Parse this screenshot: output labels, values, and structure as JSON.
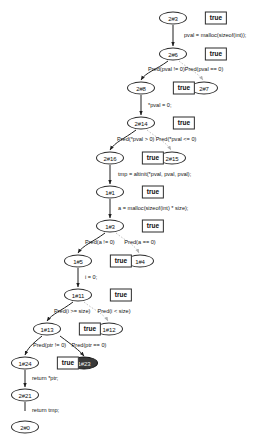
{
  "diagram": {
    "kind": "symbolic-execution-tree",
    "title": "",
    "nodes": [
      {
        "id": "n2_3",
        "label": "2#3",
        "x": 173,
        "y": 18,
        "selected": false
      },
      {
        "id": "n2_6",
        "label": "2#6",
        "x": 173,
        "y": 54,
        "selected": false
      },
      {
        "id": "n2_8",
        "label": "2#8",
        "x": 141,
        "y": 88,
        "selected": false
      },
      {
        "id": "n2_7",
        "label": "2#7",
        "x": 204,
        "y": 88,
        "selected": false
      },
      {
        "id": "n2_14",
        "label": "2#14",
        "x": 141,
        "y": 123,
        "selected": false
      },
      {
        "id": "n2_16",
        "label": "2#16",
        "x": 110,
        "y": 158,
        "selected": false
      },
      {
        "id": "n2_15",
        "label": "2#15",
        "x": 172,
        "y": 158,
        "selected": false
      },
      {
        "id": "n1_1",
        "label": "1#1",
        "x": 110,
        "y": 192,
        "selected": false
      },
      {
        "id": "n1_3",
        "label": "1#3",
        "x": 110,
        "y": 226,
        "selected": false
      },
      {
        "id": "n1_5",
        "label": "1#5",
        "x": 78,
        "y": 261,
        "selected": false
      },
      {
        "id": "n1_4",
        "label": "1#4",
        "x": 140,
        "y": 261,
        "selected": false
      },
      {
        "id": "n1_11",
        "label": "1#11",
        "x": 78,
        "y": 295,
        "selected": false
      },
      {
        "id": "n1_13",
        "label": "1#13",
        "x": 47,
        "y": 329,
        "selected": false
      },
      {
        "id": "n1_12",
        "label": "1#12",
        "x": 109,
        "y": 329,
        "selected": false
      },
      {
        "id": "n1_24",
        "label": "1#24",
        "x": 25,
        "y": 363,
        "selected": false
      },
      {
        "id": "n1_23",
        "label": "1#23",
        "x": 84,
        "y": 363,
        "selected": true
      },
      {
        "id": "n2_21",
        "label": "2#21",
        "x": 25,
        "y": 395,
        "selected": false
      },
      {
        "id": "n2_0",
        "label": "2#0",
        "x": 25,
        "y": 427,
        "selected": false
      }
    ],
    "true_badges": [
      {
        "id": "t2_3",
        "label": "true",
        "x": 216,
        "y": 18
      },
      {
        "id": "t2_6",
        "label": "true",
        "x": 216,
        "y": 54
      },
      {
        "id": "t2_8",
        "label": "true",
        "x": 184,
        "y": 88
      },
      {
        "id": "t2_14",
        "label": "true",
        "x": 184,
        "y": 123
      },
      {
        "id": "t2_16",
        "label": "true",
        "x": 153,
        "y": 158
      },
      {
        "id": "t1_1",
        "label": "true",
        "x": 153,
        "y": 192
      },
      {
        "id": "t1_3",
        "label": "true",
        "x": 153,
        "y": 226
      },
      {
        "id": "t1_5",
        "label": "true",
        "x": 121,
        "y": 261
      },
      {
        "id": "t1_11",
        "label": "true",
        "x": 121,
        "y": 295
      },
      {
        "id": "t1_13",
        "label": "true",
        "x": 90,
        "y": 329
      },
      {
        "id": "t1_24",
        "label": "true",
        "x": 68,
        "y": 363
      }
    ],
    "edge_labels": [
      {
        "id": "e_malloc_pval",
        "text": "pval = malloc(sizeof(int));",
        "x": 184,
        "y": 36,
        "anchor": "left"
      },
      {
        "id": "e_pred_pval_ne",
        "text": "Pred(pval != 0)",
        "x": 148,
        "y": 70,
        "anchor": "left"
      },
      {
        "id": "e_pred_pval_eq",
        "text": "Pred(pval == 0)",
        "x": 204,
        "y": 70,
        "anchor": "center"
      },
      {
        "id": "e_star_pval_0",
        "text": "*pval = 0;",
        "x": 148,
        "y": 106,
        "anchor": "left"
      },
      {
        "id": "e_pred_gt",
        "text": "Pred(*pval > 0)",
        "x": 117,
        "y": 140,
        "anchor": "left"
      },
      {
        "id": "e_pred_le",
        "text": "Pred(*pval <= 0)",
        "x": 176,
        "y": 140,
        "anchor": "center"
      },
      {
        "id": "e_altinit",
        "text": "tmp = altinit(*pval, pval, pval);",
        "x": 118,
        "y": 175,
        "anchor": "left"
      },
      {
        "id": "e_malloc_a",
        "text": "a = malloc(sizeof(int) * size);",
        "x": 118,
        "y": 209,
        "anchor": "left"
      },
      {
        "id": "e_pred_a_ne",
        "text": "Pred(a != 0)",
        "x": 85,
        "y": 243,
        "anchor": "left"
      },
      {
        "id": "e_pred_a_eq",
        "text": "Pred(a == 0)",
        "x": 140,
        "y": 243,
        "anchor": "center"
      },
      {
        "id": "e_i_0",
        "text": "i = 0;",
        "x": 85,
        "y": 278,
        "anchor": "left"
      },
      {
        "id": "e_pred_i_ge",
        "text": "Pred(i >= size)",
        "x": 54,
        "y": 312,
        "anchor": "left"
      },
      {
        "id": "e_pred_i_lt",
        "text": "Pred(i < size)",
        "x": 114,
        "y": 312,
        "anchor": "center"
      },
      {
        "id": "e_pred_ptr_ne",
        "text": "Pred(ptr != 0)",
        "x": 33,
        "y": 346,
        "anchor": "left"
      },
      {
        "id": "e_pred_ptr_eq",
        "text": "Pred(ptr == 0)",
        "x": 89,
        "y": 346,
        "anchor": "center"
      },
      {
        "id": "e_return_ptr",
        "text": "return *ptr;",
        "x": 32,
        "y": 379,
        "anchor": "left"
      },
      {
        "id": "e_return_tmp",
        "text": "return tmp;",
        "x": 32,
        "y": 411,
        "anchor": "left"
      }
    ],
    "colors": {
      "node_stroke": "#2b2b2b",
      "node_fill": "#ffffff",
      "selected_fill": "#3a3a3a",
      "edge_solid": "#1f1f1f",
      "edge_dashed": "#bdbdbd",
      "text": "#151515"
    }
  }
}
